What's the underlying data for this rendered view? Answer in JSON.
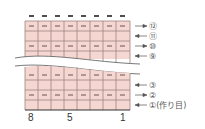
{
  "diagram": {
    "type": "knitting-chart",
    "columns": 8,
    "colors": {
      "cell_fill": "#f5d6d1",
      "grid_line": "#9c8680",
      "symbol": "#6a5550",
      "top_marks": "#222222",
      "arrow": "#555555"
    },
    "top_marks_count": 8,
    "column_labels": [
      {
        "text": "8",
        "col": 8
      },
      {
        "text": "5",
        "col": 5
      },
      {
        "text": "1",
        "col": 1
      }
    ],
    "row_labels": [
      {
        "text": "⑫",
        "direction": "right"
      },
      {
        "text": "⑪",
        "direction": "left"
      },
      {
        "text": "⑩",
        "direction": "right"
      },
      {
        "text": "⑨",
        "direction": "left"
      },
      {
        "text": "③",
        "direction": "left"
      },
      {
        "text": "②",
        "direction": "right"
      },
      {
        "text": "①(作り目)",
        "direction": "left"
      }
    ],
    "purl_rows_upper": [
      "row12",
      "row10"
    ],
    "purl_rows_lower": [
      "row4",
      "row2"
    ],
    "break_symbol": "wavy-break"
  }
}
